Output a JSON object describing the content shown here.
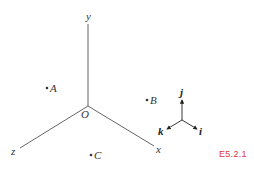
{
  "diagram": {
    "origin": {
      "label": "O",
      "x": 88,
      "y": 106
    },
    "axes": [
      {
        "name": "y",
        "label": "y",
        "x2": 88,
        "y2": 22,
        "lx": 88,
        "ly": 20
      },
      {
        "name": "z",
        "label": "z",
        "x2": 20,
        "y2": 148,
        "lx": 14,
        "ly": 155
      },
      {
        "name": "x",
        "label": "x",
        "x2": 154,
        "y2": 146,
        "lx": 158,
        "ly": 153
      }
    ],
    "points": [
      {
        "label": "A",
        "x": 46,
        "y": 89
      },
      {
        "label": "B",
        "x": 146,
        "y": 101
      },
      {
        "label": "C",
        "x": 90,
        "y": 155
      }
    ],
    "unit_vectors": {
      "center": {
        "x": 182,
        "y": 120
      },
      "j": {
        "label": "j",
        "x2": 182,
        "y2": 99
      },
      "k": {
        "label": "k",
        "x2": 166,
        "y2": 129
      },
      "i": {
        "label": "i",
        "x2": 198,
        "y2": 129
      }
    },
    "figure_label": "E5.2.1",
    "colors": {
      "axis": "#555555",
      "figure_label": "#e0383e"
    }
  }
}
